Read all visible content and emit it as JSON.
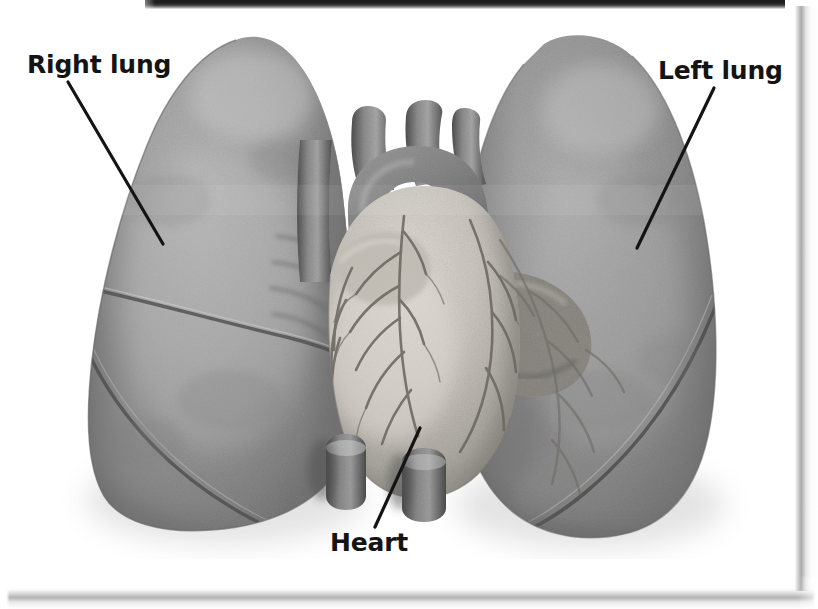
{
  "figure": {
    "kind": "anatomical-illustration",
    "rendering": "grayscale halftone scan",
    "background_color": "#ffffff",
    "ink_color": "#141414"
  },
  "labels": {
    "right_lung": "Right lung",
    "left_lung": "Left lung",
    "heart": "Heart"
  },
  "leader_lines": [
    {
      "name": "right-lung-leader",
      "x1": 68,
      "y1": 82,
      "x2": 163,
      "y2": 244
    },
    {
      "name": "left-lung-leader",
      "x1": 714,
      "y1": 88,
      "x2": 637,
      "y2": 248
    },
    {
      "name": "heart-leader",
      "x1": 375,
      "y1": 527,
      "x2": 420,
      "y2": 428
    }
  ],
  "structures": [
    {
      "name": "right-lung",
      "label": "Right lung",
      "note": "viewer left, three lobes separated by oblique and horizontal fissures"
    },
    {
      "name": "left-lung",
      "label": "Left lung",
      "note": "viewer right, two lobes with cardiac notch"
    },
    {
      "name": "heart",
      "label": "Heart",
      "note": "central, with aortic arch, great vessels and coronary vessels"
    },
    {
      "name": "aortic-arch",
      "label": "",
      "note": "arching vessel above the heart"
    },
    {
      "name": "great-vessels-stumps",
      "label": "",
      "note": "cut vessel stumps at lower midline"
    }
  ],
  "scan_artifacts": {
    "top_bar": "dark horizontal band across upper edge",
    "right_edge": "vertical page-edge shadow",
    "bottom_edge": "horizontal page-edge shadow"
  },
  "colors": {
    "lung_mid": "#8d8d8d",
    "lung_light": "#b4b4b4",
    "lung_dark": "#5e5e5e",
    "heart_light": "#cfcbc4",
    "heart_mid": "#9c9890",
    "vessel_dark": "#4a4a4a",
    "ink": "#141414",
    "page": "#ffffff"
  }
}
